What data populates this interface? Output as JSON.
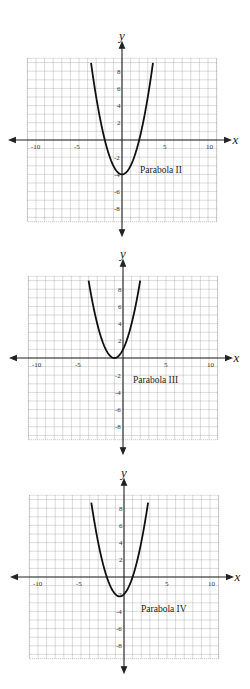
{
  "chart_data": [
    {
      "type": "line",
      "title": "Parabola II",
      "label": "Parabola II",
      "equation": "y = x^2 - 4",
      "vertex": [
        0,
        -4
      ],
      "roots": [
        -2,
        2
      ],
      "xlabel": "x",
      "ylabel": "y",
      "xlim": [
        -11,
        11
      ],
      "ylim": [
        -9.5,
        9.5
      ],
      "grid": true,
      "x_ticks": [
        "-10",
        "-5",
        "5",
        "10"
      ],
      "y_ticks": [
        "8",
        "6",
        "4",
        "2",
        "-2",
        "-4",
        "-6",
        "-8"
      ],
      "x": [
        -3.6,
        -3,
        -2,
        -1,
        0,
        1,
        2,
        3,
        3.6
      ],
      "y": [
        8.96,
        5,
        0,
        -3,
        -4,
        -3,
        0,
        5,
        8.96
      ]
    },
    {
      "type": "line",
      "title": "Parabola III",
      "label": "Parabola III",
      "equation": "y = (x + 1)^2",
      "vertex": [
        -1,
        0
      ],
      "roots": [
        -1
      ],
      "xlabel": "x",
      "ylabel": "y",
      "xlim": [
        -11,
        11
      ],
      "ylim": [
        -9.5,
        9.5
      ],
      "grid": true,
      "x_ticks": [
        "-10",
        "-5",
        "5",
        "10"
      ],
      "y_ticks": [
        "8",
        "6",
        "4",
        "2",
        "-2",
        "-4",
        "-6",
        "-8"
      ],
      "x": [
        -4,
        -3,
        -2,
        -1,
        0,
        1,
        2
      ],
      "y": [
        9,
        4,
        1,
        0,
        1,
        4,
        9
      ]
    },
    {
      "type": "line",
      "title": "Parabola IV",
      "label": "Parabola IV",
      "equation": "y = x^2 + x - 2",
      "vertex": [
        -0.5,
        -2.25
      ],
      "roots": [
        -2,
        1
      ],
      "xlabel": "x",
      "ylabel": "y",
      "xlim": [
        -11,
        11
      ],
      "ylim": [
        -9.5,
        9.5
      ],
      "grid": true,
      "x_ticks": [
        "-10",
        "-5",
        "5",
        "10"
      ],
      "y_ticks": [
        "8",
        "6",
        "4",
        "2",
        "-2",
        "-4",
        "-6",
        "-8"
      ],
      "x": [
        -3.8,
        -3,
        -2,
        -1,
        -0.5,
        0,
        1,
        2,
        2.8
      ],
      "y": [
        8.64,
        4,
        0,
        -2,
        -2.25,
        -2,
        0,
        4,
        8.64
      ]
    }
  ],
  "graphs": [
    {
      "label": "Parabola II",
      "xlabel": "x",
      "ylabel": "y"
    },
    {
      "label": "Parabola III",
      "xlabel": "x",
      "ylabel": "y"
    },
    {
      "label": "Parabola IV",
      "xlabel": "x",
      "ylabel": "y"
    }
  ],
  "ticks": {
    "xm10": "-10",
    "xm5": "-5",
    "x5": "5",
    "x10": "10",
    "y8": "8",
    "y6": "6",
    "y4": "4",
    "y2": "2",
    "ym2": "-2",
    "ym4": "-4",
    "ym6": "-6",
    "ym8": "-8"
  }
}
